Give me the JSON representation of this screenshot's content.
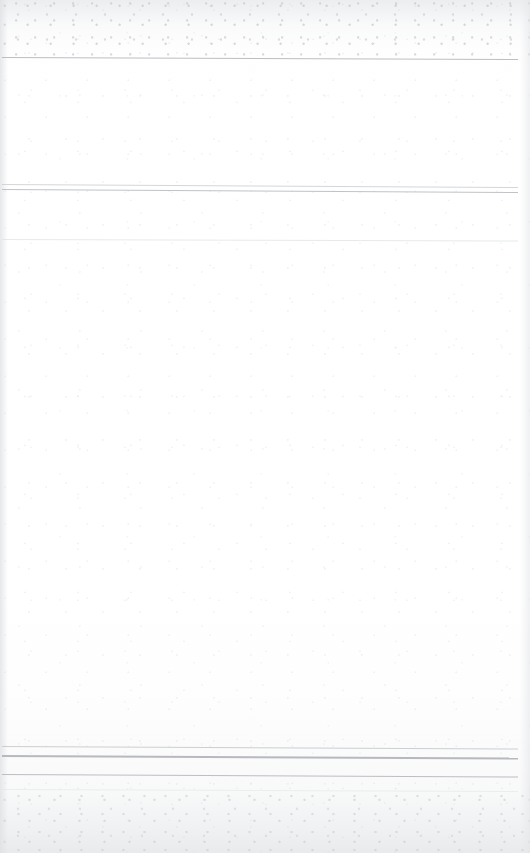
{
  "document": {
    "kind": "scanned-page",
    "description": "Near-blank scanned document page; content has faded to illegibility, leaving only faint horizontal rules.",
    "page_width": 530,
    "page_height": 853,
    "paper_color": "#ffffff",
    "rule_color": "#b9bcc1",
    "rule_color_faint": "#dfe1e4",
    "header_band_label": "",
    "title_text": "",
    "body_text": "",
    "footer_text": ""
  },
  "rules": [
    {
      "name": "top-frame-rule",
      "x": 2,
      "y": 57,
      "width": 516,
      "thickness": 1.2,
      "skew_dy": 2.0,
      "color": "#b7babf",
      "opacity": 0.95
    },
    {
      "name": "section-divider-upper",
      "x": 2,
      "y": 184,
      "width": 516,
      "thickness": 1.1,
      "skew_dy": 3.0,
      "color": "#c9ccd1",
      "opacity": 0.8
    },
    {
      "name": "section-divider-lower",
      "x": 2,
      "y": 189,
      "width": 516,
      "thickness": 1.4,
      "skew_dy": 3.0,
      "color": "#b9bcc1",
      "opacity": 0.9
    },
    {
      "name": "subsection-rule",
      "x": 2,
      "y": 239,
      "width": 516,
      "thickness": 1.0,
      "skew_dy": 1.5,
      "color": "#dde0e3",
      "opacity": 0.7
    },
    {
      "name": "footer-rule-upper",
      "x": 2,
      "y": 746,
      "width": 516,
      "thickness": 1.1,
      "skew_dy": 2.5,
      "color": "#c4c7cc",
      "opacity": 0.85
    },
    {
      "name": "footer-rule-middle",
      "x": 2,
      "y": 755,
      "width": 516,
      "thickness": 1.5,
      "skew_dy": 2.5,
      "color": "#b2b5bb",
      "opacity": 0.95
    },
    {
      "name": "footer-rule-lower",
      "x": 2,
      "y": 774,
      "width": 516,
      "thickness": 1.4,
      "skew_dy": 2.5,
      "color": "#b5b8be",
      "opacity": 0.92
    },
    {
      "name": "footer-rule-faint",
      "x": 2,
      "y": 789,
      "width": 516,
      "thickness": 1.0,
      "skew_dy": 2.0,
      "color": "#e3e5e8",
      "opacity": 0.6
    }
  ],
  "regions": [
    {
      "name": "top-margin",
      "y": 0,
      "height": 57,
      "label": ""
    },
    {
      "name": "header-band",
      "y": 57,
      "height": 127,
      "label": ""
    },
    {
      "name": "subheader-band",
      "y": 189,
      "height": 50,
      "label": ""
    },
    {
      "name": "body-area",
      "y": 239,
      "height": 507,
      "label": ""
    },
    {
      "name": "footer-band",
      "y": 746,
      "height": 43,
      "label": ""
    },
    {
      "name": "bottom-margin",
      "y": 789,
      "height": 64,
      "label": ""
    }
  ]
}
